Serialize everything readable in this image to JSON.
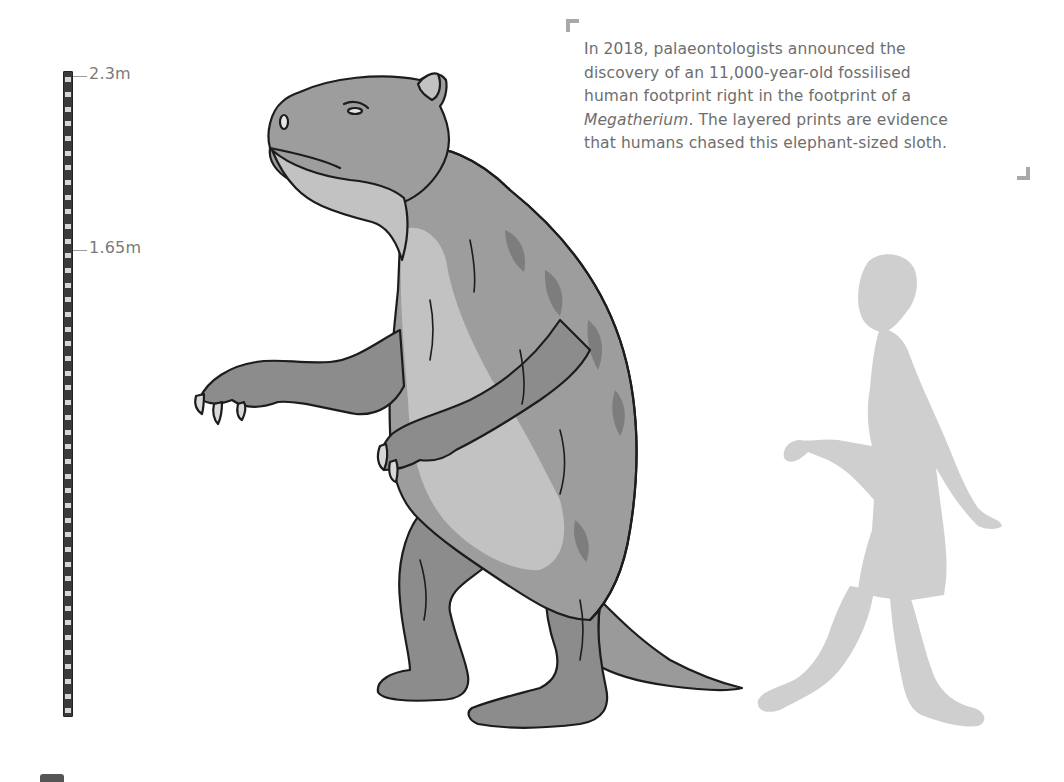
{
  "scale": {
    "labels": [
      {
        "text": "2.3m",
        "y": 76
      },
      {
        "text": "1.65m",
        "y": 250
      }
    ],
    "segment_count": 44,
    "bar_color": "#3a3a3a",
    "segment_color": "#d6d6d6"
  },
  "caption": {
    "line1": "In 2018, palaeontologists announced the",
    "line2": "discovery of an 11,000-year-old fossilised",
    "line3": "human footprint right in the footprint of a",
    "line4_italic": "Megatherium",
    "line4_rest": ". The layered prints are evidence",
    "line5": "that humans chased this elephant-sized sloth."
  },
  "figures": {
    "sloth": {
      "label": "Megatherium illustration",
      "fill_dark": "#8c8c8c",
      "fill_mid": "#9d9d9d",
      "fill_light": "#c2c2c2",
      "stroke": "#1c1c1c"
    },
    "human": {
      "label": "human silhouette",
      "fill": "#cfcfcf"
    }
  },
  "colors": {
    "text": "#6e6e6e",
    "bracket": "#a9a9a9",
    "background": "#ffffff"
  }
}
